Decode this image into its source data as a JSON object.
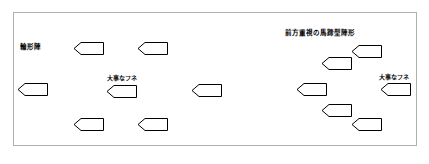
{
  "diagram": {
    "title_visible": false,
    "background_color": "#ffffff",
    "border_color": "#b0b0b0",
    "ship_outline_color": "#000000",
    "ship_fill_color": "#ffffff"
  },
  "labels": {
    "left_formation": "輪形陣",
    "right_formation": "前方重視の馬蹄型陣形",
    "left_important_ship": "大事なフネ",
    "right_important_ship": "大事なフネ"
  },
  "formations": {
    "left": {
      "name": "輪形陣",
      "ships": [
        {
          "id": "left-ring-top-1",
          "x": 74,
          "y": 42,
          "w": 30,
          "h": 13
        },
        {
          "id": "left-ring-top-2",
          "x": 138,
          "y": 42,
          "w": 30,
          "h": 13
        },
        {
          "id": "left-ring-west",
          "x": 18,
          "y": 83,
          "w": 30,
          "h": 13
        },
        {
          "id": "left-ring-center",
          "x": 107,
          "y": 85,
          "w": 30,
          "h": 13
        },
        {
          "id": "left-ring-bottom-1",
          "x": 74,
          "y": 118,
          "w": 30,
          "h": 13
        },
        {
          "id": "left-ring-bottom-2",
          "x": 138,
          "y": 118,
          "w": 30,
          "h": 13
        }
      ]
    },
    "center": {
      "name": "",
      "ships": [
        {
          "id": "center-ship",
          "x": 192,
          "y": 84,
          "w": 30,
          "h": 13
        }
      ]
    },
    "right": {
      "name": "前方重視の馬蹄型陣形",
      "ships": [
        {
          "id": "right-horseshoe-1",
          "x": 352,
          "y": 45,
          "w": 30,
          "h": 13
        },
        {
          "id": "right-horseshoe-2",
          "x": 322,
          "y": 57,
          "w": 30,
          "h": 13
        },
        {
          "id": "right-horseshoe-3",
          "x": 297,
          "y": 83,
          "w": 30,
          "h": 13
        },
        {
          "id": "right-horseshoe-center",
          "x": 381,
          "y": 83,
          "w": 30,
          "h": 13
        },
        {
          "id": "right-horseshoe-4",
          "x": 322,
          "y": 104,
          "w": 30,
          "h": 13
        },
        {
          "id": "right-horseshoe-5",
          "x": 352,
          "y": 118,
          "w": 30,
          "h": 13
        }
      ]
    }
  },
  "label_positions": {
    "left_formation": {
      "x": 20,
      "y": 44
    },
    "right_formation": {
      "x": 285,
      "y": 30
    },
    "left_important_ship": {
      "x": 107,
      "y": 75
    },
    "right_important_ship": {
      "x": 379,
      "y": 74
    }
  }
}
